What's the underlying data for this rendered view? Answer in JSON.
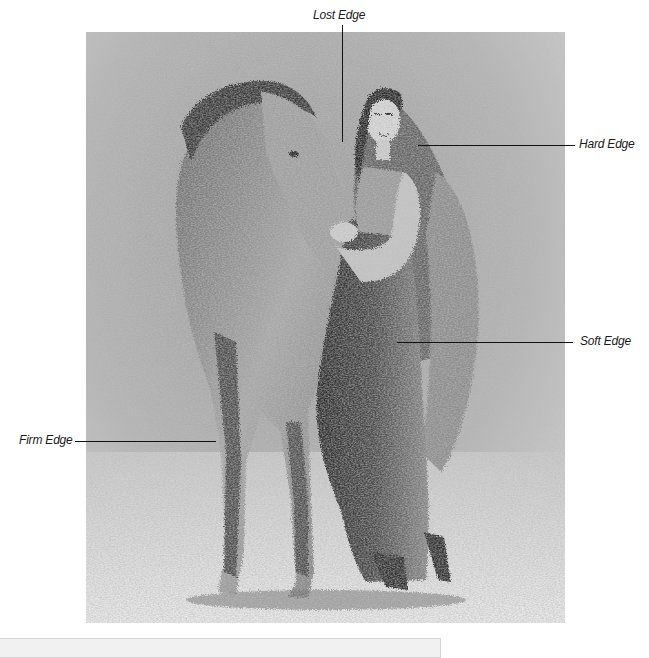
{
  "figure": {
    "subjects": [
      "horse",
      "woman"
    ],
    "medium": "graphite on textured paper",
    "colors": {
      "background_paper": "#bdbdbd",
      "dark_tone": "#2a2a2a",
      "light_tone": "#e8e8e8",
      "leader_line": "#111111",
      "label_text": "#1a1a1a",
      "caption_box": "#f1f1f1"
    }
  },
  "annotations": [
    {
      "id": "lost",
      "label": "Lost Edge",
      "position": "top",
      "target": "horse ear against background"
    },
    {
      "id": "hard",
      "label": "Hard Edge",
      "position": "right-upper",
      "target": "woman's face/hair edge"
    },
    {
      "id": "soft",
      "label": "Soft Edge",
      "position": "right-middle",
      "target": "dress fold"
    },
    {
      "id": "firm",
      "label": "Firm Edge",
      "position": "left-lower",
      "target": "horse foreleg"
    }
  ],
  "caption_box": {
    "visible": true,
    "text": ""
  }
}
